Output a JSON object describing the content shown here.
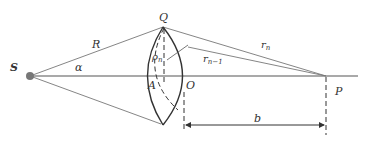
{
  "diagram": {
    "type": "optics-zone-plate-geometry",
    "colors": {
      "line": "#555555",
      "lens": "#333333",
      "dashed": "#333333",
      "source_dot": "#777777",
      "text": "#333333"
    },
    "labels": {
      "source": "S",
      "top_point": "Q",
      "radius": "R",
      "angle": "α",
      "rho_main": "ρ",
      "rho_sub": "n",
      "r_n_main": "r",
      "r_n_sub": "n",
      "r_n1_main": "r",
      "r_n1_sub": "n−1",
      "vertex_a": "A",
      "vertex_o": "O",
      "observation_point": "P",
      "distance": "b"
    }
  }
}
